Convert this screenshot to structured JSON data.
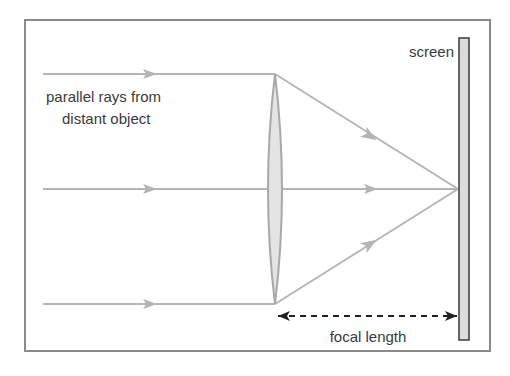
{
  "diagram": {
    "labels": {
      "rays": [
        "parallel rays from",
        "distant object"
      ],
      "screen": "screen",
      "focal_length": "focal length"
    },
    "colors": {
      "frame": "#8a8a8a",
      "ray": "#b5b5b5",
      "lens_fill": "#e4e4e4",
      "lens_stroke": "#a8a8a8",
      "screen_fill": "#dcdcdc",
      "screen_stroke": "#3a3a3a",
      "text": "#3a3a3a",
      "dimension_line": "#222222"
    },
    "elements": {
      "rays_count": 3,
      "lens": "convex lens",
      "screen": "screen",
      "dimension": "focal length (lens to screen)"
    }
  }
}
